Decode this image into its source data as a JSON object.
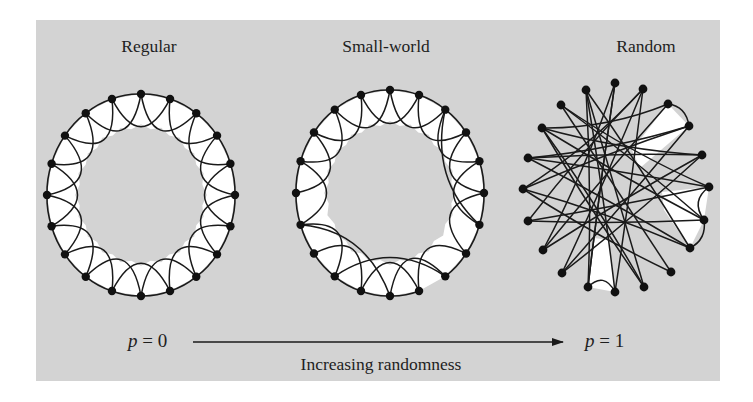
{
  "figure": {
    "titles": {
      "regular": "Regular",
      "small_world": "Small-world",
      "random": "Random"
    },
    "axis": {
      "left_label_var": "p",
      "left_label_eq": " = 0",
      "right_label_var": "p",
      "right_label_eq": " = 1",
      "caption": "Increasing randomness"
    },
    "colors": {
      "panel_background": "#d3d3d3",
      "ring_fill": "#ffffff",
      "stroke": "#1a1a1a",
      "node": "#111111"
    }
  },
  "graphs": {
    "regular": {
      "center": [
        141,
        195
      ],
      "radius": [
        94,
        101
      ],
      "node_count": 20,
      "neighbors_k": 4,
      "missing_ring_edges": [],
      "rewired_edges": []
    },
    "small_world": {
      "center": [
        390,
        193
      ],
      "radius": [
        94,
        103
      ],
      "node_count": 20,
      "neighbors_k": 4,
      "missing_ring_edges": [
        [
          9,
          8
        ]
      ],
      "removed_skip_edges": [
        [
          13,
          15
        ],
        [
          10,
          12
        ],
        [
          8,
          6
        ]
      ],
      "rewired_edges": [
        [
          14,
          10
        ],
        [
          12,
          8
        ],
        [
          6,
          2
        ]
      ]
    },
    "random": {
      "nodes": [
        [
          615,
          83
        ],
        [
          643,
          89
        ],
        [
          668,
          104
        ],
        [
          689,
          126
        ],
        [
          702,
          155
        ],
        [
          709,
          187
        ],
        [
          704,
          220
        ],
        [
          690,
          248
        ],
        [
          671,
          272
        ],
        [
          644,
          287
        ],
        [
          615,
          292
        ],
        [
          588,
          287
        ],
        [
          562,
          273
        ],
        [
          543,
          250
        ],
        [
          528,
          221
        ],
        [
          523,
          189
        ],
        [
          528,
          158
        ],
        [
          542,
          128
        ],
        [
          561,
          105
        ],
        [
          586,
          90
        ]
      ],
      "edges": [
        [
          0,
          13
        ],
        [
          0,
          11
        ],
        [
          1,
          12
        ],
        [
          1,
          14
        ],
        [
          1,
          15
        ],
        [
          2,
          3
        ],
        [
          2,
          17
        ],
        [
          2,
          13
        ],
        [
          3,
          16
        ],
        [
          3,
          15
        ],
        [
          4,
          17
        ],
        [
          4,
          12
        ],
        [
          5,
          6
        ],
        [
          5,
          16
        ],
        [
          5,
          18
        ],
        [
          6,
          7
        ],
        [
          6,
          17
        ],
        [
          6,
          14
        ],
        [
          7,
          16
        ],
        [
          7,
          19
        ],
        [
          8,
          18
        ],
        [
          8,
          15
        ],
        [
          9,
          19
        ],
        [
          9,
          17
        ],
        [
          10,
          11
        ],
        [
          10,
          1
        ],
        [
          11,
          19
        ],
        [
          12,
          3
        ],
        [
          13,
          4
        ],
        [
          14,
          5
        ],
        [
          15,
          7
        ],
        [
          16,
          4
        ],
        [
          17,
          9
        ],
        [
          18,
          6
        ],
        [
          19,
          10
        ],
        [
          11,
          0
        ]
      ],
      "white_regions": [
        [
          [
            668,
            104
          ],
          [
            689,
            126
          ],
          [
            640,
            168
          ],
          [
            632,
            150
          ]
        ],
        [
          [
            709,
            187
          ],
          [
            704,
            220
          ],
          [
            690,
            248
          ],
          [
            664,
            210
          ],
          [
            662,
            192
          ]
        ],
        [
          [
            588,
            287
          ],
          [
            615,
            292
          ],
          [
            609,
            240
          ],
          [
            594,
            238
          ]
        ]
      ]
    }
  }
}
